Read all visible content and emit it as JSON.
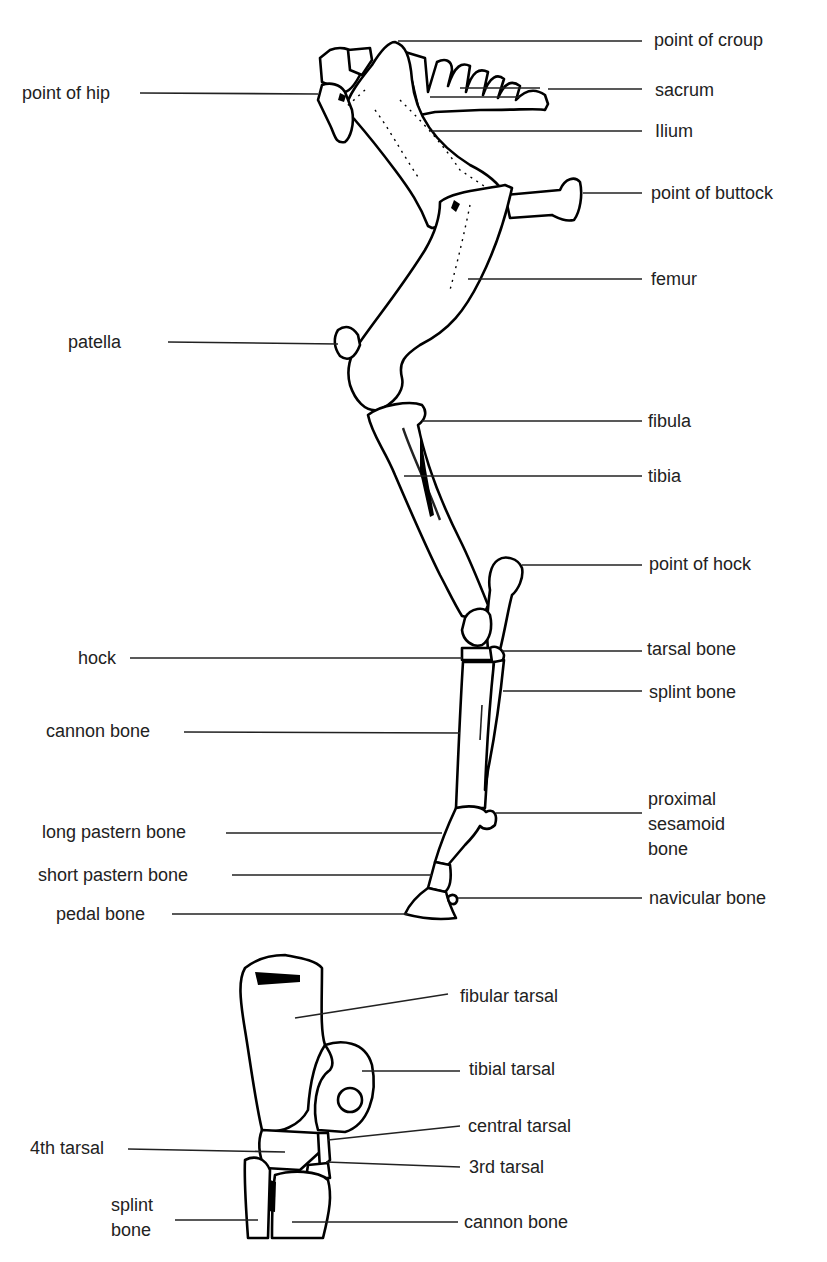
{
  "leg_diagram": {
    "labels_left": [
      {
        "id": "point-of-hip",
        "text": "point of hip",
        "x": 22,
        "y": 83
      },
      {
        "id": "patella",
        "text": "patella",
        "x": 68,
        "y": 331
      },
      {
        "id": "hock",
        "text": "hock",
        "x": 78,
        "y": 647
      },
      {
        "id": "cannon-bone",
        "text": "cannon bone",
        "x": 46,
        "y": 720
      },
      {
        "id": "long-pastern-bone",
        "text": "long pastern bone",
        "x": 42,
        "y": 821
      },
      {
        "id": "short-pastern-bone",
        "text": "short pastern bone",
        "x": 38,
        "y": 864
      },
      {
        "id": "pedal-bone",
        "text": "pedal bone",
        "x": 56,
        "y": 903
      }
    ],
    "labels_right": [
      {
        "id": "point-of-croup",
        "text": "point of croup",
        "x": 654,
        "y": 29
      },
      {
        "id": "sacrum",
        "text": "sacrum",
        "x": 655,
        "y": 79
      },
      {
        "id": "ilium",
        "text": "Ilium",
        "x": 655,
        "y": 120
      },
      {
        "id": "point-of-buttock",
        "text": "point of buttock",
        "x": 651,
        "y": 183
      },
      {
        "id": "femur",
        "text": "femur",
        "x": 651,
        "y": 268
      },
      {
        "id": "fibula",
        "text": "fibula",
        "x": 648,
        "y": 411
      },
      {
        "id": "tibia",
        "text": "tibia",
        "x": 648,
        "y": 466
      },
      {
        "id": "point-of-hock",
        "text": "point of hock",
        "x": 649,
        "y": 553
      },
      {
        "id": "tarsal-bone",
        "text": "tarsal bone",
        "x": 647,
        "y": 638
      },
      {
        "id": "splint-bone",
        "text": "splint bone",
        "x": 649,
        "y": 681
      },
      {
        "id": "proximal-sesamoid-bone",
        "text": "proximal\nsesamoid\nbone",
        "x": 648,
        "y": 787
      },
      {
        "id": "navicular-bone",
        "text": "navicular bone",
        "x": 649,
        "y": 888
      }
    ]
  },
  "hock_detail": {
    "labels_left": [
      {
        "id": "4th-tarsal",
        "text": "4th tarsal",
        "x": 30,
        "y": 1137
      },
      {
        "id": "splint-bone-detail",
        "text": "splint\nbone",
        "x": 111,
        "y": 1193
      }
    ],
    "labels_right": [
      {
        "id": "fibular-tarsal",
        "text": "fibular tarsal",
        "x": 460,
        "y": 985
      },
      {
        "id": "tibial-tarsal",
        "text": "tibial tarsal",
        "x": 469,
        "y": 1057
      },
      {
        "id": "central-tarsal",
        "text": "central tarsal",
        "x": 468,
        "y": 1115
      },
      {
        "id": "3rd-tarsal",
        "text": "3rd tarsal",
        "x": 469,
        "y": 1156
      },
      {
        "id": "cannon-bone-detail",
        "text": "cannon bone",
        "x": 464,
        "y": 1211
      }
    ]
  },
  "colors": {
    "ink": "#000000",
    "background": "#ffffff",
    "label": "#222222"
  }
}
